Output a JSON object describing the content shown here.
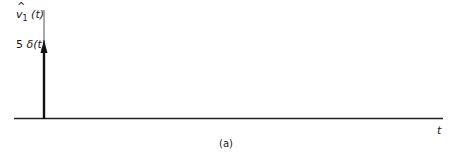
{
  "figure": {
    "y_axis_label": {
      "symbol": "v",
      "hat": "^",
      "subscript": "1",
      "arg": "(t)"
    },
    "impulse_label": {
      "coef": "5",
      "symbol": "δ",
      "arg": "(t)"
    },
    "x_axis_label": "t",
    "caption": "(a)",
    "impulse": {
      "position": "t=0",
      "strength": 5
    },
    "colors": {
      "ink": "#1a1a1a",
      "background": "#ffffff"
    }
  }
}
